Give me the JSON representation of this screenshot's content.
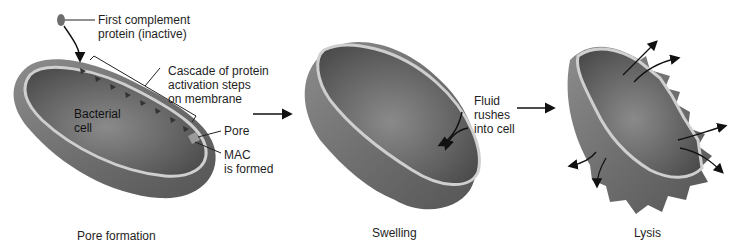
{
  "diagram": {
    "colors": {
      "cell_dark": "#5a5a5a",
      "cell_mid": "#7d7d7d",
      "cell_light": "#a6a6a6",
      "membrane": "#c9c9c9",
      "arrow": "#111111",
      "protein": "#6e6e6e"
    },
    "panels": [
      {
        "id": "pore-formation",
        "caption": "Pore formation",
        "labels": {
          "first_protein": "First complement\nprotein (inactive)",
          "cascade": "Cascade of protein\nactivation steps\non membrane",
          "bacterial_cell": "Bacterial\ncell",
          "pore": "Pore",
          "mac": "MAC\nis formed"
        }
      },
      {
        "id": "swelling",
        "caption": "Swelling",
        "labels": {
          "fluid": "Fluid\nrushes\ninto cell"
        }
      },
      {
        "id": "lysis",
        "caption": "Lysis",
        "labels": {}
      }
    ],
    "transition_arrows": [
      "pore-formation→swelling",
      "swelling→lysis"
    ]
  }
}
